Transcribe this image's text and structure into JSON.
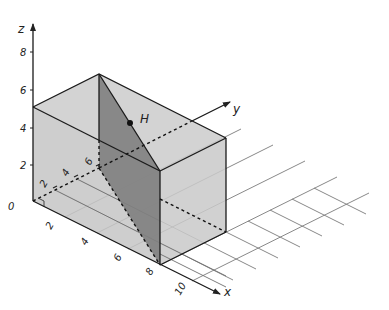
{
  "diagram": {
    "type": "3d-coordinate-box",
    "axes": {
      "x": {
        "label": "x",
        "ticks": [
          "2",
          "4",
          "6",
          "8",
          "10"
        ]
      },
      "y": {
        "label": "y",
        "ticks": [
          "2",
          "4",
          "6"
        ]
      },
      "z": {
        "label": "z",
        "ticks": [
          "0",
          "2",
          "4",
          "6",
          "8"
        ]
      }
    },
    "box": {
      "x_range": [
        0,
        8
      ],
      "y_range": [
        0,
        6
      ],
      "z_range": [
        0,
        5
      ]
    },
    "plane": {
      "description": "vertical plane through (0,6,z) and (8,0,z)"
    },
    "point": {
      "label": "H",
      "coords": [
        4,
        3,
        5
      ]
    },
    "colors": {
      "box_fill": "#c9c9c9",
      "plane_fill": "#7d7d7d",
      "plane_fill_back": "#8c8c8c",
      "grid": "#777777",
      "edge": "#222222"
    }
  }
}
